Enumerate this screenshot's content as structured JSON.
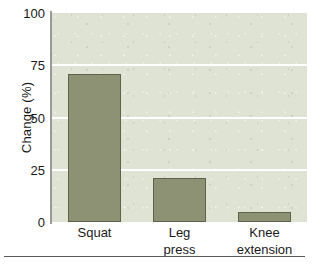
{
  "chart_data": {
    "type": "bar",
    "title": "",
    "subtitle": "",
    "xlabel": "",
    "ylabel": "Change (%)",
    "categories": [
      "Squat",
      "Leg press",
      "Knee extension"
    ],
    "category_lines": [
      [
        "Squat"
      ],
      [
        "Leg",
        "press"
      ],
      [
        "Knee",
        "extension"
      ]
    ],
    "values": [
      71,
      21,
      5
    ],
    "ylim": [
      0,
      100
    ],
    "ytick_labels": [
      "100",
      "75",
      "50",
      "25",
      "0"
    ],
    "ytick_values": [
      100,
      75,
      50,
      25,
      0
    ],
    "gridlines": [
      75,
      50,
      25
    ],
    "grid": true,
    "legend": null,
    "legend_position": "none",
    "colors": {
      "bar_fill": "#8e9274",
      "bar_edge": "#5f6349",
      "panel_background": "#dfe3d3",
      "gridline": "#ffffff",
      "axis": "#9a9a9a",
      "text": "#1a1a1a",
      "figure_background": "#ffffff",
      "rule": "#5a5a5a"
    }
  }
}
